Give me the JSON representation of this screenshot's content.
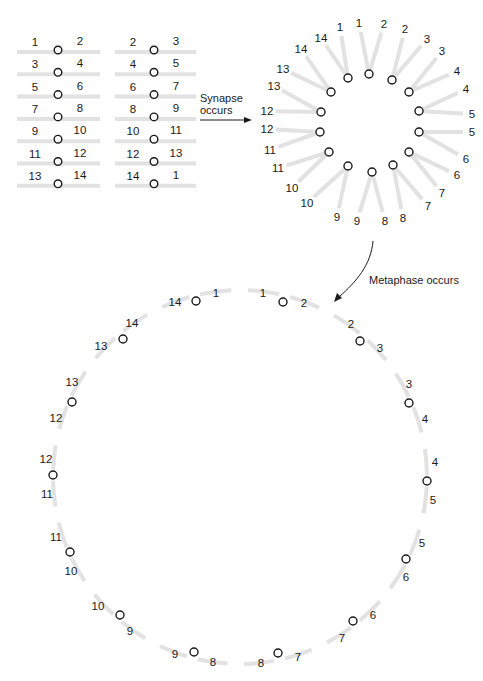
{
  "figure": {
    "colors": {
      "arm": "#e2e2e2",
      "centromere_stroke": "#1a1a1a",
      "text": "#1a1a1a",
      "background": "#ffffff"
    }
  },
  "paired_chromosomes": {
    "columns": [
      {
        "name": "left-column",
        "rows": [
          {
            "left": "1",
            "right": "2"
          },
          {
            "left": "3",
            "right": "4"
          },
          {
            "left": "5",
            "right": "6"
          },
          {
            "left": "7",
            "right": "8"
          },
          {
            "left": "9",
            "right": "10"
          },
          {
            "left": "11",
            "right": "12"
          },
          {
            "left": "13",
            "right": "14"
          }
        ]
      },
      {
        "name": "right-column",
        "rows": [
          {
            "left": "2",
            "right": "3"
          },
          {
            "left": "4",
            "right": "5"
          },
          {
            "left": "6",
            "right": "7"
          },
          {
            "left": "8",
            "right": "9"
          },
          {
            "left": "10",
            "right": "11"
          },
          {
            "left": "12",
            "right": "13"
          },
          {
            "left": "14",
            "right": "1"
          }
        ]
      }
    ]
  },
  "synapse_arrow": {
    "line1": "Synapse",
    "line2": "occurs"
  },
  "rosette": {
    "centromeres": [
      {
        "x": 369,
        "y": 74,
        "arms": [
          {
            "lx": 359,
            "ly": 23,
            "label": "1"
          },
          {
            "lx": 384,
            "ly": 24,
            "label": "2"
          }
        ]
      },
      {
        "x": 392,
        "y": 80,
        "arms": [
          {
            "lx": 405,
            "ly": 29,
            "label": "2"
          },
          {
            "lx": 427,
            "ly": 39,
            "label": "3"
          }
        ]
      },
      {
        "x": 409,
        "y": 92,
        "arms": [
          {
            "lx": 442,
            "ly": 51,
            "label": "3"
          },
          {
            "lx": 457,
            "ly": 71,
            "label": "4"
          }
        ]
      },
      {
        "x": 419,
        "y": 111,
        "arms": [
          {
            "lx": 466,
            "ly": 89,
            "label": "4"
          },
          {
            "lx": 472,
            "ly": 114,
            "label": "5"
          }
        ]
      },
      {
        "x": 419,
        "y": 132,
        "arms": [
          {
            "lx": 472,
            "ly": 132,
            "label": "5"
          },
          {
            "lx": 466,
            "ly": 159,
            "label": "6"
          }
        ]
      },
      {
        "x": 409,
        "y": 152,
        "arms": [
          {
            "lx": 457,
            "ly": 175,
            "label": "6"
          },
          {
            "lx": 442,
            "ly": 193,
            "label": "7"
          }
        ]
      },
      {
        "x": 393,
        "y": 165,
        "arms": [
          {
            "lx": 428,
            "ly": 206,
            "label": "7"
          },
          {
            "lx": 403,
            "ly": 218,
            "label": "8"
          }
        ]
      },
      {
        "x": 372,
        "y": 172,
        "arms": [
          {
            "lx": 385,
            "ly": 221,
            "label": "8"
          },
          {
            "lx": 357,
            "ly": 221,
            "label": "9"
          }
        ]
      },
      {
        "x": 348,
        "y": 166,
        "arms": [
          {
            "lx": 337,
            "ly": 217,
            "label": "9"
          },
          {
            "lx": 307,
            "ly": 203,
            "label": "10"
          }
        ]
      },
      {
        "x": 329,
        "y": 152,
        "arms": [
          {
            "lx": 292,
            "ly": 188,
            "label": "10"
          },
          {
            "lx": 278,
            "ly": 168,
            "label": "11"
          }
        ]
      },
      {
        "x": 320,
        "y": 132,
        "arms": [
          {
            "lx": 270,
            "ly": 150,
            "label": "11"
          },
          {
            "lx": 267,
            "ly": 129,
            "label": "12"
          }
        ]
      },
      {
        "x": 321,
        "y": 112,
        "arms": [
          {
            "lx": 267,
            "ly": 111,
            "label": "12"
          },
          {
            "lx": 274,
            "ly": 86,
            "label": "13"
          }
        ]
      },
      {
        "x": 331,
        "y": 92,
        "arms": [
          {
            "lx": 283,
            "ly": 69,
            "label": "13"
          },
          {
            "lx": 301,
            "ly": 49,
            "label": "14"
          }
        ]
      },
      {
        "x": 348,
        "y": 78,
        "arms": [
          {
            "lx": 321,
            "ly": 38,
            "label": "14"
          },
          {
            "lx": 340,
            "ly": 27,
            "label": "1"
          }
        ]
      }
    ]
  },
  "metaphase_arrow": {
    "label": "Metaphase occurs"
  },
  "metaphase_ring": {
    "center": {
      "x": 240,
      "y": 477
    },
    "radius": 187,
    "centromeres": [
      {
        "x": 196,
        "y": 301,
        "labels": [
          {
            "x": 175,
            "y": 302,
            "text": "14"
          },
          {
            "x": 216,
            "y": 293,
            "text": "1"
          }
        ]
      },
      {
        "x": 283,
        "y": 302,
        "labels": [
          {
            "x": 263,
            "y": 293,
            "text": "1"
          },
          {
            "x": 304,
            "y": 303,
            "text": "2"
          }
        ]
      },
      {
        "x": 360,
        "y": 341,
        "labels": [
          {
            "x": 351,
            "y": 324,
            "text": "2"
          },
          {
            "x": 380,
            "y": 348,
            "text": "3"
          }
        ]
      },
      {
        "x": 409,
        "y": 403,
        "labels": [
          {
            "x": 409,
            "y": 384,
            "text": "3"
          },
          {
            "x": 425,
            "y": 419,
            "text": "4"
          }
        ]
      },
      {
        "x": 427,
        "y": 481,
        "labels": [
          {
            "x": 435,
            "y": 462,
            "text": "4"
          },
          {
            "x": 433,
            "y": 500,
            "text": "5"
          }
        ]
      },
      {
        "x": 406,
        "y": 559,
        "labels": [
          {
            "x": 422,
            "y": 543,
            "text": "5"
          },
          {
            "x": 406,
            "y": 577,
            "text": "6"
          }
        ]
      },
      {
        "x": 353,
        "y": 621,
        "labels": [
          {
            "x": 373,
            "y": 615,
            "text": "6"
          },
          {
            "x": 342,
            "y": 638,
            "text": "7"
          }
        ]
      },
      {
        "x": 278,
        "y": 653,
        "labels": [
          {
            "x": 298,
            "y": 657,
            "text": "7"
          },
          {
            "x": 261,
            "y": 663,
            "text": "8"
          }
        ]
      },
      {
        "x": 194,
        "y": 652,
        "labels": [
          {
            "x": 213,
            "y": 662,
            "text": "8"
          },
          {
            "x": 175,
            "y": 654,
            "text": "9"
          }
        ]
      },
      {
        "x": 120,
        "y": 615,
        "labels": [
          {
            "x": 130,
            "y": 631,
            "text": "9"
          },
          {
            "x": 98,
            "y": 606,
            "text": "10"
          }
        ]
      },
      {
        "x": 70,
        "y": 552,
        "labels": [
          {
            "x": 71,
            "y": 571,
            "text": "10"
          },
          {
            "x": 56,
            "y": 537,
            "text": "11"
          }
        ]
      },
      {
        "x": 53,
        "y": 475,
        "labels": [
          {
            "x": 47,
            "y": 494,
            "text": "11"
          },
          {
            "x": 46,
            "y": 459,
            "text": "12"
          }
        ]
      },
      {
        "x": 72,
        "y": 402,
        "labels": [
          {
            "x": 56,
            "y": 418,
            "text": "12"
          },
          {
            "x": 72,
            "y": 382,
            "text": "13"
          }
        ]
      },
      {
        "x": 123,
        "y": 339,
        "labels": [
          {
            "x": 101,
            "y": 346,
            "text": "13"
          },
          {
            "x": 132,
            "y": 323,
            "text": "14"
          }
        ]
      }
    ]
  }
}
